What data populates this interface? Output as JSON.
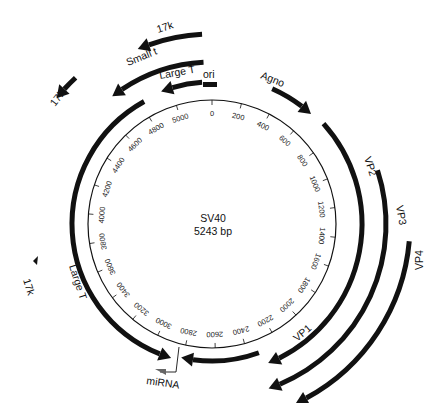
{
  "genome": {
    "name": "SV40",
    "size_label": "5243 bp",
    "length_bp": 5243
  },
  "scale": {
    "tick_labels": [
      "0",
      "200",
      "400",
      "600",
      "800",
      "1000",
      "1200",
      "1400",
      "1600",
      "1800",
      "2000",
      "2200",
      "2400",
      "2600",
      "2800",
      "3000",
      "3200",
      "3400",
      "3600",
      "3800",
      "4000",
      "4200",
      "4400",
      "4600",
      "4800",
      "5000"
    ]
  },
  "features": {
    "ori": {
      "label": "ori"
    },
    "agno": {
      "label": "Agno"
    },
    "vp1": {
      "label": "VP1"
    },
    "vp2": {
      "label": "VP2"
    },
    "vp3": {
      "label": "VP3"
    },
    "vp4": {
      "label": "VP4"
    },
    "large_t_outer": {
      "label": "Large T"
    },
    "large_t_inner": {
      "label": "Large T"
    },
    "small_t": {
      "label": "Small t"
    },
    "k17_top": {
      "label": "17k"
    },
    "k17_left": {
      "label": "17k"
    },
    "k17_small": {
      "label": "17k"
    },
    "mirna": {
      "label": "miRNA"
    }
  },
  "colors": {
    "ink": "#111111",
    "background": "#ffffff"
  }
}
